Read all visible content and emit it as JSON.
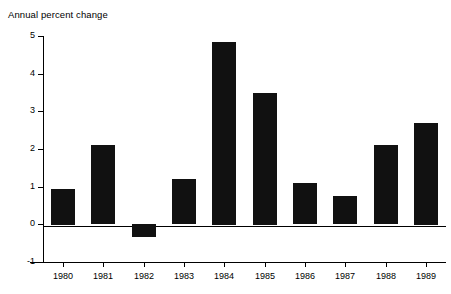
{
  "chart_data": {
    "type": "bar",
    "title": "Annual percent change",
    "xlabel": "",
    "ylabel": "",
    "categories": [
      "1980",
      "1981",
      "1982",
      "1983",
      "1984",
      "1985",
      "1986",
      "1987",
      "1988",
      "1989"
    ],
    "values": [
      0.95,
      2.1,
      -0.35,
      1.2,
      4.85,
      3.5,
      1.1,
      0.75,
      2.1,
      2.7
    ],
    "series": [
      {
        "name": "Annual percent change",
        "values": [
          0.95,
          2.1,
          -0.35,
          1.2,
          4.85,
          3.5,
          1.1,
          0.75,
          2.1,
          2.7
        ]
      }
    ],
    "ylim": [
      -1,
      5
    ],
    "yticks": [
      "5",
      "4",
      "3",
      "2",
      "1",
      "0",
      "-1"
    ],
    "ytick_values": [
      5,
      4,
      3,
      2,
      1,
      0,
      -1
    ],
    "grid": false,
    "legend": false,
    "legend_position": "none",
    "bar_color": "#111111",
    "axis_color": "#000000",
    "background_color": "#ffffff"
  }
}
